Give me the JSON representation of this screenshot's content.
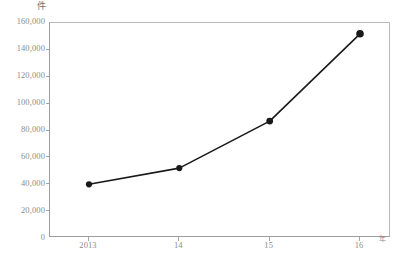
{
  "chart_data": {
    "type": "line",
    "title": "",
    "subtitle": "",
    "xlabel": "年",
    "ylabel": "件",
    "categories": [
      "2013",
      "14",
      "15",
      "16"
    ],
    "x": [
      2013,
      2014,
      2015,
      2016
    ],
    "values": [
      40000,
      52000,
      87000,
      152000
    ],
    "series": [
      {
        "name": "",
        "values": [
          40000,
          52000,
          87000,
          152000
        ]
      }
    ],
    "ylim": [
      0,
      160000
    ],
    "y_ticks": [
      0,
      20000,
      40000,
      60000,
      80000,
      100000,
      120000,
      140000,
      160000
    ],
    "y_tick_labels": [
      "0",
      "20,000",
      "40,000",
      "60,000",
      "80,000",
      "100,000",
      "120,000",
      "140,000",
      "160,000"
    ],
    "x_tick_labels": [
      "2013",
      "14",
      "15",
      "16"
    ],
    "grid": false,
    "legend": null,
    "legend_position": "none",
    "annotations": [],
    "marker": "filled-circle",
    "line_color": "#1a1a1a",
    "marker_color": "#1a1a1a",
    "axis_color": "#9d9d9d",
    "tick_label_color": "#8c8c8c",
    "background_color": "#ffffff"
  },
  "axes": {
    "y_unit": "件",
    "x_unit": "年"
  }
}
